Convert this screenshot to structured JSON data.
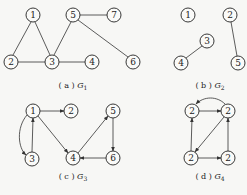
{
  "graphs": [
    {
      "id": "G1",
      "caption_prefix": "( a )",
      "caption_name": "G",
      "caption_sub": "1",
      "directed": false,
      "nodes": [
        {
          "id": "g1n1",
          "label": "1",
          "x": 33,
          "y": 15
        },
        {
          "id": "g1n2",
          "label": "2",
          "x": 11,
          "y": 62
        },
        {
          "id": "g1n3",
          "label": "3",
          "x": 52,
          "y": 62
        },
        {
          "id": "g1n4",
          "label": "4",
          "x": 92,
          "y": 62
        },
        {
          "id": "g1n5",
          "label": "5",
          "x": 73,
          "y": 15
        },
        {
          "id": "g1n6",
          "label": "6",
          "x": 133,
          "y": 62
        },
        {
          "id": "g1n7",
          "label": "7",
          "x": 114,
          "y": 15
        }
      ],
      "edges": [
        [
          "1",
          "2"
        ],
        [
          "1",
          "3"
        ],
        [
          "2",
          "3"
        ],
        [
          "3",
          "4"
        ],
        [
          "3",
          "5"
        ],
        [
          "5",
          "7"
        ],
        [
          "5",
          "6"
        ]
      ]
    },
    {
      "id": "G2",
      "caption_prefix": "( b )",
      "caption_name": "G",
      "caption_sub": "2",
      "directed": false,
      "nodes": [
        {
          "id": "g2n1",
          "label": "1",
          "x": 188,
          "y": 15
        },
        {
          "id": "g2n2",
          "label": "2",
          "x": 230,
          "y": 15
        },
        {
          "id": "g2n3",
          "label": "3",
          "x": 207,
          "y": 41
        },
        {
          "id": "g2n4",
          "label": "4",
          "x": 181,
          "y": 63
        },
        {
          "id": "g2n5",
          "label": "5",
          "x": 238,
          "y": 63
        }
      ],
      "edges": [
        [
          "3",
          "4"
        ],
        [
          "2",
          "5"
        ]
      ]
    },
    {
      "id": "G3",
      "caption_prefix": "( c )",
      "caption_name": "G",
      "caption_sub": "3",
      "directed": true,
      "nodes": [
        {
          "id": "g3n1",
          "label": "1",
          "x": 33,
          "y": 111
        },
        {
          "id": "g3n2",
          "label": "2",
          "x": 71,
          "y": 111
        },
        {
          "id": "g3n3",
          "label": "3",
          "x": 32,
          "y": 159
        },
        {
          "id": "g3n4",
          "label": "4",
          "x": 73,
          "y": 158
        },
        {
          "id": "g3n5",
          "label": "5",
          "x": 113,
          "y": 111
        },
        {
          "id": "g3n6",
          "label": "6",
          "x": 113,
          "y": 158
        }
      ],
      "edges": [
        [
          "1",
          "2"
        ],
        [
          "1",
          "4"
        ],
        [
          "3",
          "1"
        ],
        [
          "1",
          "3",
          "curved"
        ],
        [
          "4",
          "5"
        ],
        [
          "5",
          "6"
        ],
        [
          "6",
          "4"
        ]
      ]
    },
    {
      "id": "G4",
      "caption_prefix": "( d )",
      "caption_name": "G",
      "caption_sub": "4",
      "directed": true,
      "nodes": [
        {
          "id": "g4tl",
          "label": "2",
          "x": 192,
          "y": 111
        },
        {
          "id": "g4tr",
          "label": "2",
          "x": 228,
          "y": 111
        },
        {
          "id": "g4bl",
          "label": "2",
          "x": 191,
          "y": 158
        },
        {
          "id": "g4br",
          "label": "2",
          "x": 228,
          "y": 158
        }
      ],
      "edges": [
        [
          "tl",
          "tr"
        ],
        [
          "tr",
          "tl",
          "curved"
        ],
        [
          "tr",
          "bl"
        ],
        [
          "bl",
          "tl"
        ],
        [
          "bl",
          "br"
        ],
        [
          "br",
          "tr"
        ]
      ]
    }
  ]
}
